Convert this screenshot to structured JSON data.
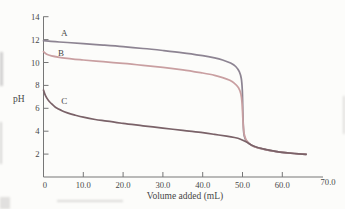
{
  "figure": {
    "background": "#fcfcfa",
    "axis_color": "#767676",
    "tick_label_color": "#4a4a4a",
    "curve_label_color": "#555555"
  },
  "chart_data": {
    "type": "line",
    "title": "",
    "xlabel": "Volume added (mL)",
    "ylabel": "pH",
    "xlim": [
      0,
      70
    ],
    "ylim": [
      0,
      14
    ],
    "grid": false,
    "legend_position": "inline-curve-labels",
    "x_ticks": [
      {
        "value": 0,
        "label": "0",
        "mark": false
      },
      {
        "value": 10,
        "label": "10.0",
        "mark": true
      },
      {
        "value": 20,
        "label": "20.0",
        "mark": true
      },
      {
        "value": 30,
        "label": "30.0",
        "mark": true
      },
      {
        "value": 40,
        "label": "40.0",
        "mark": true
      },
      {
        "value": 50,
        "label": "50.0",
        "mark": true
      },
      {
        "value": 60,
        "label": "60.0",
        "mark": true
      },
      {
        "value": 70,
        "label": "70.0",
        "mark": false,
        "end_label": true
      }
    ],
    "y_ticks": [
      {
        "value": 2,
        "label": "2"
      },
      {
        "value": 4,
        "label": "4"
      },
      {
        "value": 6,
        "label": "6"
      },
      {
        "value": 8,
        "label": "8"
      },
      {
        "value": 10,
        "label": "10"
      },
      {
        "value": 12,
        "label": "12"
      },
      {
        "value": 14,
        "label": "14"
      }
    ],
    "equivalence_volume_mL": 50.0,
    "series": [
      {
        "name": "A",
        "color": "#8d8492",
        "label_at": [
          5.2,
          12.3
        ],
        "points": [
          [
            0,
            11.9
          ],
          [
            3,
            11.82
          ],
          [
            6,
            11.75
          ],
          [
            10,
            11.65
          ],
          [
            15,
            11.52
          ],
          [
            20,
            11.38
          ],
          [
            25,
            11.22
          ],
          [
            30,
            11.05
          ],
          [
            35,
            10.85
          ],
          [
            40,
            10.6
          ],
          [
            43,
            10.4
          ],
          [
            45,
            10.22
          ],
          [
            47,
            9.95
          ],
          [
            48.3,
            9.65
          ],
          [
            49.2,
            9.2
          ],
          [
            49.7,
            8.6
          ],
          [
            49.95,
            7.6
          ],
          [
            50.1,
            5.6
          ],
          [
            50.3,
            3.9
          ],
          [
            50.7,
            3.3
          ],
          [
            51.5,
            2.95
          ],
          [
            53,
            2.65
          ],
          [
            55,
            2.45
          ],
          [
            57,
            2.3
          ],
          [
            60,
            2.15
          ],
          [
            63,
            2.05
          ],
          [
            66,
            1.98
          ]
        ]
      },
      {
        "name": "B",
        "color": "#c99fa1",
        "label_at": [
          4.4,
          10.55
        ],
        "points": [
          [
            0,
            10.95
          ],
          [
            0.8,
            10.72
          ],
          [
            2,
            10.58
          ],
          [
            4,
            10.45
          ],
          [
            7,
            10.32
          ],
          [
            10,
            10.22
          ],
          [
            15,
            10.07
          ],
          [
            20,
            9.92
          ],
          [
            25,
            9.75
          ],
          [
            30,
            9.57
          ],
          [
            35,
            9.36
          ],
          [
            40,
            9.08
          ],
          [
            43,
            8.88
          ],
          [
            45,
            8.68
          ],
          [
            46.8,
            8.45
          ],
          [
            48,
            8.18
          ],
          [
            49,
            7.8
          ],
          [
            49.6,
            7.25
          ],
          [
            49.9,
            6.4
          ],
          [
            50.1,
            5.0
          ],
          [
            50.4,
            3.8
          ],
          [
            50.9,
            3.25
          ],
          [
            51.8,
            2.9
          ],
          [
            53,
            2.65
          ],
          [
            55,
            2.45
          ],
          [
            57,
            2.3
          ],
          [
            60,
            2.15
          ],
          [
            63,
            2.05
          ],
          [
            66,
            1.98
          ]
        ]
      },
      {
        "name": "C",
        "color": "#7a6268",
        "label_at": [
          5.2,
          6.4
        ],
        "points": [
          [
            0,
            7.6
          ],
          [
            0.5,
            7.1
          ],
          [
            1.2,
            6.7
          ],
          [
            2,
            6.4
          ],
          [
            3,
            6.1
          ],
          [
            4.5,
            5.82
          ],
          [
            6,
            5.6
          ],
          [
            8,
            5.4
          ],
          [
            10,
            5.22
          ],
          [
            13,
            5.02
          ],
          [
            16,
            4.87
          ],
          [
            20,
            4.68
          ],
          [
            25,
            4.47
          ],
          [
            30,
            4.27
          ],
          [
            35,
            4.07
          ],
          [
            40,
            3.87
          ],
          [
            43,
            3.72
          ],
          [
            46,
            3.57
          ],
          [
            48,
            3.45
          ],
          [
            49.5,
            3.3
          ],
          [
            51,
            3.05
          ],
          [
            52.5,
            2.75
          ],
          [
            54,
            2.55
          ],
          [
            56,
            2.38
          ],
          [
            58,
            2.25
          ],
          [
            60,
            2.15
          ],
          [
            63,
            2.05
          ],
          [
            66,
            1.98
          ]
        ]
      }
    ]
  }
}
